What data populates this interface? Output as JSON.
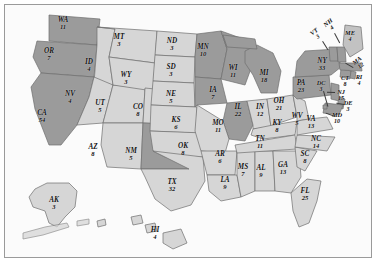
{
  "map": {
    "title": "United States Electoral College Map",
    "frame_color": "#9a9a9a",
    "background_color": "#fbfbfb",
    "ocean_color": "#ffffff",
    "legend": {
      "dark_fill": "#9b9b9b",
      "light_fill": "#d4d4d4",
      "border_color": "#6f6f6f",
      "dark_meaning": "dark shaded state",
      "light_meaning": "light shaded state"
    },
    "states": [
      {
        "id": "WA",
        "abbr": "WA",
        "value": "11",
        "shade": "dark",
        "x": 58,
        "y": 18
      },
      {
        "id": "OR",
        "abbr": "OR",
        "value": "7",
        "shade": "dark",
        "x": 44,
        "y": 49
      },
      {
        "id": "CA",
        "abbr": "CA",
        "value": "54",
        "shade": "dark",
        "x": 37,
        "y": 111
      },
      {
        "id": "ID",
        "abbr": "ID",
        "value": "4",
        "shade": "light",
        "x": 84,
        "y": 60
      },
      {
        "id": "NV",
        "abbr": "NV",
        "value": "4",
        "shade": "light",
        "x": 65,
        "y": 92
      },
      {
        "id": "UT",
        "abbr": "UT",
        "value": "5",
        "shade": "light",
        "x": 95,
        "y": 101
      },
      {
        "id": "AZ",
        "abbr": "AZ",
        "value": "8",
        "shade": "light",
        "x": 88,
        "y": 145
      },
      {
        "id": "MT",
        "abbr": "MT",
        "value": "3",
        "shade": "light",
        "x": 114,
        "y": 35
      },
      {
        "id": "WY",
        "abbr": "WY",
        "value": "3",
        "shade": "light",
        "x": 121,
        "y": 73
      },
      {
        "id": "CO",
        "abbr": "CO",
        "value": "8",
        "shade": "light",
        "x": 133,
        "y": 105
      },
      {
        "id": "NM",
        "abbr": "NM",
        "value": "5",
        "shade": "dark",
        "x": 126,
        "y": 149
      },
      {
        "id": "ND",
        "abbr": "ND",
        "value": "3",
        "shade": "light",
        "x": 167,
        "y": 39
      },
      {
        "id": "SD",
        "abbr": "SD",
        "value": "3",
        "shade": "light",
        "x": 166,
        "y": 65
      },
      {
        "id": "NE",
        "abbr": "NE",
        "value": "5",
        "shade": "light",
        "x": 166,
        "y": 92
      },
      {
        "id": "KS",
        "abbr": "KS",
        "value": "6",
        "shade": "light",
        "x": 171,
        "y": 118
      },
      {
        "id": "OK",
        "abbr": "OK",
        "value": "8",
        "shade": "light",
        "x": 178,
        "y": 144
      },
      {
        "id": "TX",
        "abbr": "TX",
        "value": "32",
        "shade": "light",
        "x": 167,
        "y": 180
      },
      {
        "id": "MN",
        "abbr": "MN",
        "value": "10",
        "shade": "dark",
        "x": 198,
        "y": 45
      },
      {
        "id": "IA",
        "abbr": "IA",
        "value": "7",
        "shade": "dark",
        "x": 208,
        "y": 88
      },
      {
        "id": "MO",
        "abbr": "MO",
        "value": "11",
        "shade": "light",
        "x": 213,
        "y": 121
      },
      {
        "id": "AR",
        "abbr": "AR",
        "value": "6",
        "shade": "light",
        "x": 215,
        "y": 152
      },
      {
        "id": "LA",
        "abbr": "LA",
        "value": "9",
        "shade": "light",
        "x": 220,
        "y": 178
      },
      {
        "id": "WI",
        "abbr": "WI",
        "value": "11",
        "shade": "dark",
        "x": 228,
        "y": 66
      },
      {
        "id": "IL",
        "abbr": "IL",
        "value": "22",
        "shade": "dark",
        "x": 233,
        "y": 105
      },
      {
        "id": "MS",
        "abbr": "MS",
        "value": "7",
        "shade": "light",
        "x": 238,
        "y": 165
      },
      {
        "id": "MI",
        "abbr": "MI",
        "value": "18",
        "shade": "dark",
        "x": 259,
        "y": 71
      },
      {
        "id": "IN",
        "abbr": "IN",
        "value": "12",
        "shade": "light",
        "x": 255,
        "y": 105
      },
      {
        "id": "TN",
        "abbr": "TN",
        "value": "11",
        "shade": "light",
        "x": 255,
        "y": 137
      },
      {
        "id": "AL",
        "abbr": "AL",
        "value": "9",
        "shade": "light",
        "x": 256,
        "y": 166
      },
      {
        "id": "OH",
        "abbr": "OH",
        "value": "21",
        "shade": "light",
        "x": 274,
        "y": 99
      },
      {
        "id": "KY",
        "abbr": "KY",
        "value": "8",
        "shade": "light",
        "x": 272,
        "y": 121
      },
      {
        "id": "GA",
        "abbr": "GA",
        "value": "13",
        "shade": "light",
        "x": 278,
        "y": 163
      },
      {
        "id": "WV",
        "abbr": "WV",
        "value": "5",
        "shade": "light",
        "x": 292,
        "y": 114
      },
      {
        "id": "PA",
        "abbr": "PA",
        "value": "23",
        "shade": "dark",
        "x": 296,
        "y": 81
      },
      {
        "id": "VA",
        "abbr": "VA",
        "value": "13",
        "shade": "light",
        "x": 306,
        "y": 117
      },
      {
        "id": "NC",
        "abbr": "NC",
        "value": "14",
        "shade": "light",
        "x": 311,
        "y": 137
      },
      {
        "id": "SC",
        "abbr": "SC",
        "value": "8",
        "shade": "light",
        "x": 300,
        "y": 152
      },
      {
        "id": "FL",
        "abbr": "FL",
        "value": "25",
        "shade": "light",
        "x": 300,
        "y": 189
      },
      {
        "id": "NY",
        "abbr": "NY",
        "value": "33",
        "shade": "dark",
        "x": 317,
        "y": 59
      },
      {
        "id": "DC",
        "abbr": "DC",
        "value": "3",
        "shade": "dark",
        "x": 316,
        "y": 81
      },
      {
        "id": "MD",
        "abbr": "MD",
        "value": "10",
        "shade": "dark",
        "x": 332,
        "y": 113
      },
      {
        "id": "DE",
        "abbr": "DE",
        "value": "3",
        "shade": "dark",
        "x": 343,
        "y": 101
      },
      {
        "id": "NJ",
        "abbr": "NJ",
        "value": "15",
        "shade": "dark",
        "x": 336,
        "y": 90
      },
      {
        "id": "CT",
        "abbr": "CT",
        "value": "8",
        "shade": "dark",
        "x": 340,
        "y": 76
      },
      {
        "id": "RI",
        "abbr": "RI",
        "value": "4",
        "shade": "dark",
        "x": 354,
        "y": 75
      },
      {
        "id": "MA",
        "abbr": "MA",
        "value": "12",
        "shade": "dark",
        "x": 354,
        "y": 58
      },
      {
        "id": "VT",
        "abbr": "VT",
        "value": "3",
        "shade": "dark",
        "x": 311,
        "y": 29
      },
      {
        "id": "NH",
        "abbr": "NH",
        "value": "4",
        "shade": "dark",
        "x": 325,
        "y": 20
      },
      {
        "id": "ME",
        "abbr": "ME",
        "value": "4",
        "shade": "light",
        "x": 345,
        "y": 31
      },
      {
        "id": "AK",
        "abbr": "AK",
        "value": "3",
        "shade": "light",
        "x": 49,
        "y": 198
      },
      {
        "id": "HI",
        "abbr": "HI",
        "value": "4",
        "shade": "light",
        "x": 150,
        "y": 228
      }
    ]
  }
}
